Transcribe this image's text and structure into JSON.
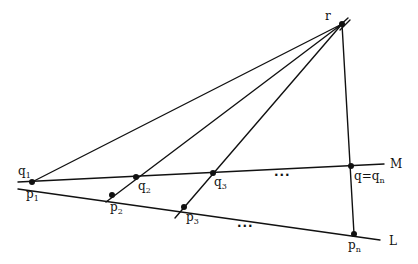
{
  "diagram": {
    "colors": {
      "ink": "#111111",
      "background": "#ffffff"
    },
    "apex": {
      "label": "r",
      "x": 342,
      "y": 24
    },
    "lines": {
      "M": {
        "label": "M",
        "from": [
          18,
          182
        ],
        "to": [
          384,
          164
        ]
      },
      "L": {
        "label": "L",
        "from": [
          18,
          190
        ],
        "to": [
          380,
          240
        ]
      }
    },
    "points": {
      "p1_q1": {
        "label_top": "q",
        "label_top_sub": "1",
        "label_bottom": "p",
        "label_bottom_sub": "1",
        "x": 32,
        "y": 182
      },
      "q2": {
        "label": "q",
        "sub": "2",
        "x": 136,
        "y": 177
      },
      "q3": {
        "label": "q",
        "sub": "3",
        "x": 213,
        "y": 173
      },
      "qn": {
        "label": "q=q",
        "sub": "n",
        "x": 351,
        "y": 166
      },
      "p2": {
        "label": "p",
        "sub": "2",
        "x": 112,
        "y": 195
      },
      "p3": {
        "label": "p",
        "sub": "3",
        "x": 184,
        "y": 207
      },
      "pn": {
        "label": "p",
        "sub": "n",
        "x": 354,
        "y": 234
      }
    },
    "ellipsis_M": "...",
    "ellipsis_L": "..."
  }
}
